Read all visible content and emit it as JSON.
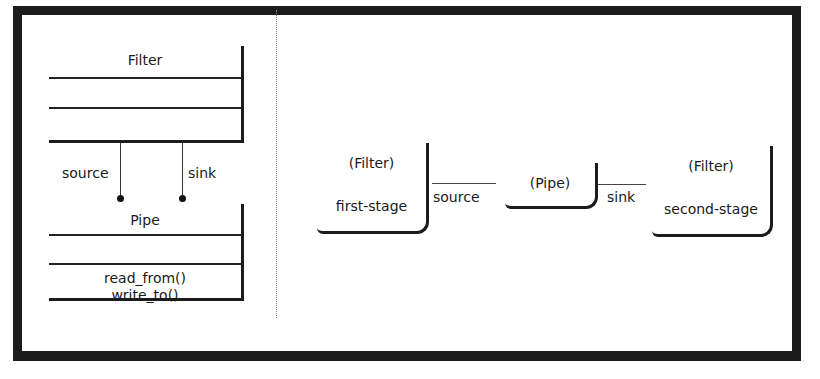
{
  "uml_class_diagram": {
    "filter_class": {
      "name": "Filter",
      "attributes": [],
      "operations": []
    },
    "pipe_class": {
      "name": "Pipe",
      "attributes": [],
      "operations": [
        "read_from()",
        "write_to()"
      ]
    },
    "associations": [
      {
        "role": "source",
        "from": "Filter",
        "to": "Pipe"
      },
      {
        "role": "sink",
        "from": "Filter",
        "to": "Pipe"
      }
    ]
  },
  "object_diagram": {
    "objects": [
      {
        "type": "(Filter)",
        "name": "first-stage"
      },
      {
        "type": "(Pipe)",
        "name": ""
      },
      {
        "type": "(Filter)",
        "name": "second-stage"
      }
    ],
    "links": [
      {
        "label": "source",
        "from": "first-stage",
        "to": "Pipe"
      },
      {
        "label": "sink",
        "from": "Pipe",
        "to": "second-stage"
      }
    ]
  }
}
